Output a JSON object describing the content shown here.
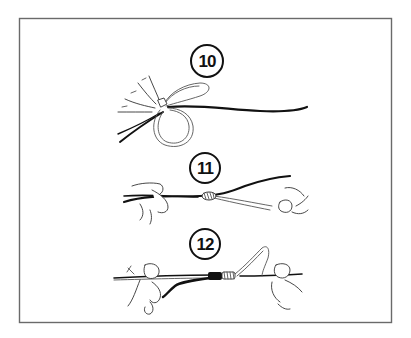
{
  "figure": {
    "type": "knot-tying instruction illustration",
    "frame_color": "#6a6a6a",
    "ink_color": "#111111",
    "background": "#ffffff",
    "steps": [
      {
        "number": "10",
        "description": "line looped through with loop and tag ends held between fingers"
      },
      {
        "number": "11",
        "description": "hands pulling line tight, small wraps forming at the knot"
      },
      {
        "number": "12",
        "description": "knot snugged with dark wraps and light coils, loop remaining on right"
      }
    ]
  }
}
